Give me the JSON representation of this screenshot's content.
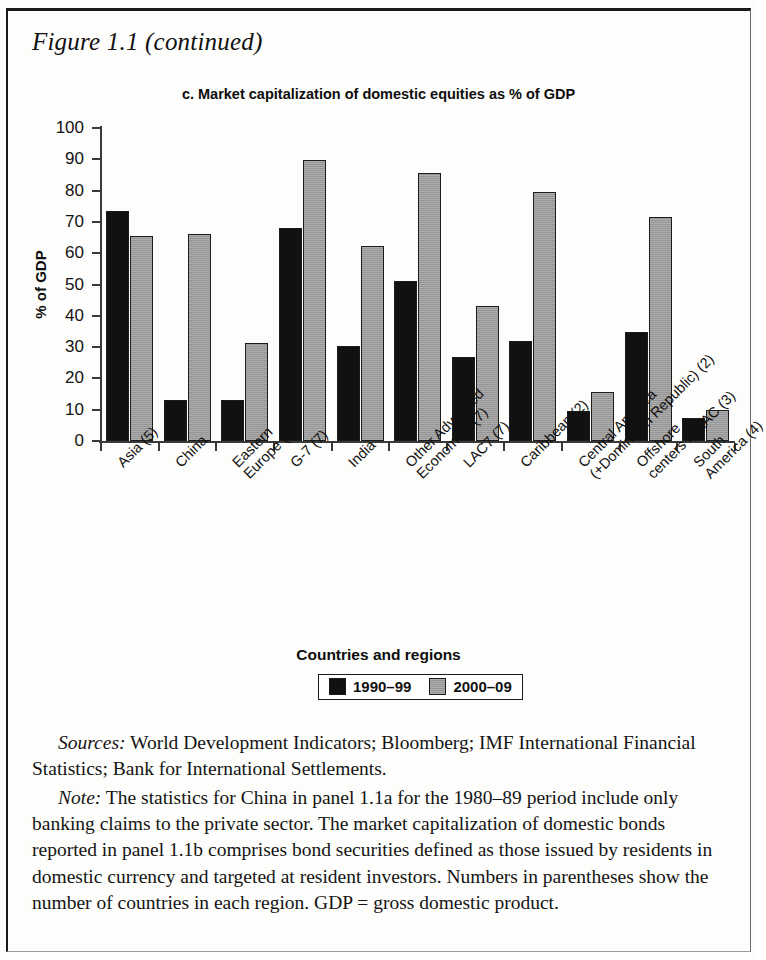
{
  "figure": {
    "label": "Figure 1.1 (continued)"
  },
  "chart": {
    "title": "c. Market capitalization of domestic equities  as % of GDP",
    "y_axis_title": "% of GDP",
    "x_axis_title": "Countries and regions",
    "y_ticks": [
      "100",
      "90",
      "80",
      "70",
      "60",
      "50",
      "40",
      "30",
      "20",
      "10",
      "0"
    ]
  },
  "legend": {
    "items": [
      {
        "label": "1990–99",
        "color": "#111111"
      },
      {
        "label": "2000–09",
        "color": "#9d9d9d"
      }
    ]
  },
  "chart_data": {
    "type": "bar",
    "title": "c. Market capitalization of domestic equities  as % of GDP",
    "xlabel": "Countries and regions",
    "ylabel": "% of GDP",
    "ylim": [
      0,
      100
    ],
    "ytick_step": 10,
    "grid": false,
    "legend_position": "bottom",
    "categories": [
      "Asia (5)",
      "China",
      "Eastern\nEurope (7)",
      "G-7 (7)",
      "India",
      "Other Advanced\nEconomies (7)",
      "LAC7 (7)",
      "Caribbean (2)",
      "Central America\n(+Dominican Republic) (2)",
      "Offshore\ncenters in LAC (3)",
      "South\nAmerica (4)"
    ],
    "series": [
      {
        "name": "1990–99",
        "color": "#111111",
        "values": [
          73.5,
          13.0,
          13.2,
          68.0,
          30.2,
          51.0,
          27.0,
          32.0,
          9.5,
          34.7,
          7.5
        ]
      },
      {
        "name": "2000–09",
        "color": "#9d9d9d",
        "values": [
          65.6,
          66.2,
          31.3,
          89.8,
          62.3,
          85.5,
          43.0,
          79.6,
          15.8,
          71.5,
          9.8
        ]
      }
    ]
  },
  "notes": {
    "sources_lead": "Sources:",
    "sources_text": " World Development Indicators; Bloomberg; IMF International Financial Statistics; Bank for International Settlements.",
    "note_lead": "Note:",
    "note_text": " The statistics for China in panel 1.1a for the 1980–89 period include only banking claims to the private sector. The market capitalization of domestic bonds reported in panel 1.1b comprises bond securities defined as those issued by residents in domestic currency and targeted at resident investors. Numbers in parentheses show the number of countries in each region. GDP = gross domestic product."
  }
}
